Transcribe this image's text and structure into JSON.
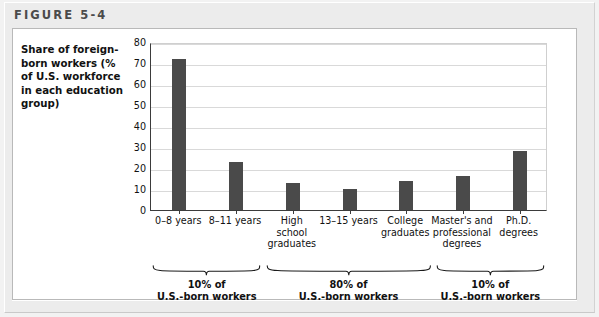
{
  "figure": {
    "label": "FIGURE 5-4"
  },
  "axis_title": "Share of foreign-born workers (% of U.S. workforce in each education group)",
  "colors": {
    "bar": "#4a4a4a",
    "axis": "#3b3b3b",
    "gridline": "#d9d9d9",
    "panel_background": "#ffffff",
    "frame_background": "#ececec"
  },
  "chart_data": {
    "type": "bar",
    "title": "FIGURE 5-4",
    "ylabel": "Share of foreign-born workers (% of U.S. workforce in each education group)",
    "xlabel": "",
    "ylim": [
      0,
      80
    ],
    "yticks": [
      0,
      10,
      20,
      30,
      40,
      50,
      60,
      70,
      80
    ],
    "ytick_labels": [
      "0",
      "10",
      "20",
      "30",
      "40",
      "50",
      "60",
      "70",
      "80"
    ],
    "grid": true,
    "legend": "none",
    "categories": [
      "0–8 years",
      "8–11 years",
      "High school graduates",
      "13–15 years",
      "College graduates",
      "Master's and professional degrees",
      "Ph.D. degrees"
    ],
    "category_lines": [
      [
        "0–8 years"
      ],
      [
        "8–11 years"
      ],
      [
        "High",
        "school",
        "graduates"
      ],
      [
        "13–15 years"
      ],
      [
        "College",
        "graduates"
      ],
      [
        "Master's and",
        "professional",
        "degrees"
      ],
      [
        "Ph.D.",
        "degrees"
      ]
    ],
    "values": [
      72,
      23,
      13,
      10,
      14,
      16,
      28
    ],
    "groups": [
      {
        "percent": "10% of",
        "workers": "U.S.-born workers",
        "first_category_index": 0,
        "last_category_index": 1
      },
      {
        "percent": "80% of",
        "workers": "U.S.-born workers",
        "first_category_index": 2,
        "last_category_index": 4
      },
      {
        "percent": "10% of",
        "workers": "U.S.-born workers",
        "first_category_index": 5,
        "last_category_index": 6
      }
    ]
  }
}
